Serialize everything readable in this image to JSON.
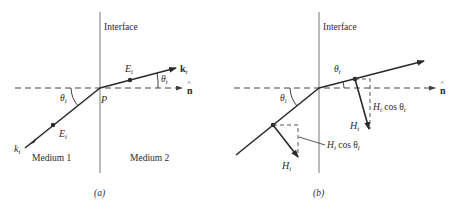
{
  "figure": {
    "panel_a": {
      "caption": "(a)",
      "interface_label": "Interface",
      "medium_1": "Medium 1",
      "medium_2": "Medium 2",
      "point_label": "P",
      "normal_label": "n",
      "normal_hat": "^",
      "k_incident": "k",
      "k_incident_sub": "i",
      "k_transmitted": "k",
      "k_transmitted_sub": "t",
      "e_incident": "E",
      "e_incident_sub": "i",
      "e_transmitted": "E",
      "e_transmitted_sub": "t",
      "theta_incident": "θ",
      "theta_incident_sub": "i",
      "theta_transmitted": "θ",
      "theta_transmitted_sub": "t"
    },
    "panel_b": {
      "caption": "(b)",
      "interface_label": "Interface",
      "normal_label": "n",
      "normal_hat": "^",
      "theta_incident": "θ",
      "theta_incident_sub": "i",
      "theta_transmitted": "θ",
      "theta_transmitted_sub": "t",
      "h_incident": "H",
      "h_incident_sub": "i",
      "h_transmitted": "H",
      "h_transmitted_sub": "t",
      "h_i_cos_label": "H",
      "h_i_cos_sub": "i",
      "h_i_cos_rest": " cos θ",
      "h_i_cos_sub2": "i",
      "h_t_cos_label": "H",
      "h_t_cos_sub": "t",
      "h_t_cos_rest": " cos θ",
      "h_t_cos_sub2": "t"
    },
    "colors": {
      "ink": "#2a2a2a",
      "line": "#555555",
      "background": "#ffffff"
    }
  }
}
